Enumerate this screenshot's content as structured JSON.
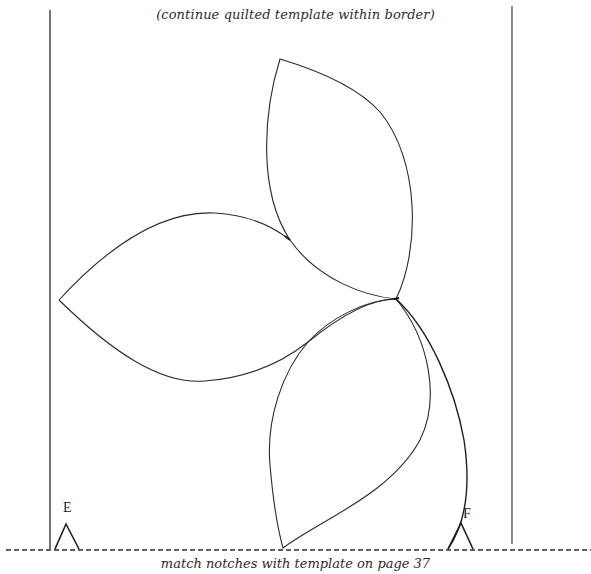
{
  "document": {
    "top_caption": "(continue quilted template within border)",
    "bottom_caption": "match notches with template on page 37",
    "notches": [
      {
        "label": "E",
        "position": "left"
      },
      {
        "label": "F",
        "position": "right"
      }
    ],
    "template": {
      "shape": "three-petal flower with stem",
      "petals": [
        "top petal",
        "left petal",
        "bottom petal"
      ],
      "border": "left and right solid border lines",
      "cut_line": "dashed horizontal line"
    },
    "colors": {
      "line": "#2a2a2a",
      "background": "#ffffff"
    }
  }
}
